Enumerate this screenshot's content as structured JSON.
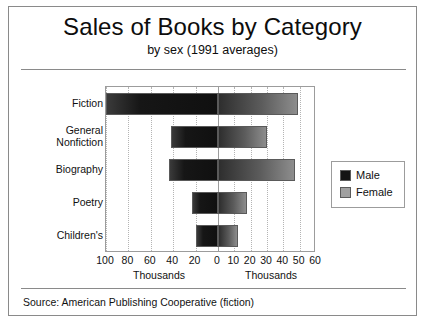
{
  "chart_data": {
    "type": "bar",
    "orientation": "horizontal",
    "style": "bidirectional-tornado",
    "title": "Sales of Books by Category",
    "subtitle": "by sex (1991 averages)",
    "categories": [
      "Fiction",
      "General\nNonfiction",
      "Biography",
      "Poetry",
      "Children's"
    ],
    "series": [
      {
        "name": "Male",
        "color": "#141414",
        "direction": "left",
        "values": [
          100,
          42,
          44,
          23,
          20
        ]
      },
      {
        "name": "Female",
        "color": "#a0a0a0",
        "direction": "right",
        "values": [
          49,
          30,
          47,
          18,
          12
        ]
      }
    ],
    "left_axis": {
      "label": "Thousands",
      "ticks": [
        "100",
        "80",
        "60",
        "40",
        "20",
        "0"
      ],
      "tick_values": [
        100,
        80,
        60,
        40,
        20,
        0
      ],
      "max": 100
    },
    "right_axis": {
      "label": "Thousands",
      "ticks": [
        "0",
        "10",
        "20",
        "30",
        "40",
        "50",
        "60"
      ],
      "tick_values": [
        0,
        10,
        20,
        30,
        40,
        50,
        60
      ],
      "max": 60
    },
    "xlabel": "Thousands",
    "ylabel": "",
    "grid": true,
    "grid_style": "dotted-vertical",
    "legend": {
      "position": "right",
      "entries": [
        "Male",
        "Female"
      ]
    },
    "source": "Source: American Publishing Cooperative (fiction)",
    "units": "Thousands"
  },
  "legend": {
    "male_label": "Male",
    "female_label": "Female"
  },
  "footer": {
    "source": "Source: American Publishing Cooperative (fiction)"
  }
}
